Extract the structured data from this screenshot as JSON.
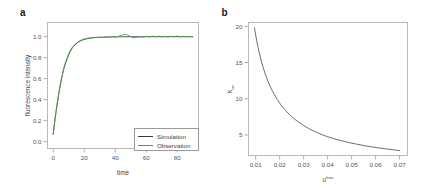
{
  "figure": {
    "panels": [
      {
        "letter": "a",
        "chart_data": {
          "type": "line",
          "title": "",
          "xlabel": "time",
          "ylabel": "fluorescence intensity",
          "xlim": [
            -4,
            94
          ],
          "ylim": [
            -0.07,
            1.14
          ],
          "xticks": [
            0,
            20,
            40,
            60,
            80
          ],
          "xtick_labels": [
            "0",
            "20",
            "40",
            "60",
            "80"
          ],
          "yticks": [
            0.0,
            0.2,
            0.4,
            0.6,
            0.8,
            1.0
          ],
          "ytick_labels": [
            "0.0",
            "0.2",
            "0.4",
            "0.6",
            "0.8",
            "1.0"
          ],
          "grid": false,
          "legend_position": "lower right",
          "series": [
            {
              "name": "Simulation",
              "color": "#3a3a3a",
              "x": [
                0,
                1,
                2,
                3,
                4,
                5,
                6,
                7,
                8,
                9,
                10,
                11,
                12,
                13,
                14,
                15,
                16,
                17,
                18,
                19,
                20,
                22,
                24,
                26,
                28,
                30,
                34,
                38,
                42,
                46,
                50,
                54,
                58,
                62,
                66,
                70,
                74,
                78,
                82,
                86,
                90
              ],
              "values": [
                0.07,
                0.19,
                0.3,
                0.4,
                0.49,
                0.57,
                0.64,
                0.7,
                0.75,
                0.79,
                0.83,
                0.86,
                0.885,
                0.905,
                0.922,
                0.936,
                0.947,
                0.956,
                0.963,
                0.969,
                0.974,
                0.981,
                0.986,
                0.99,
                0.992,
                0.994,
                0.996,
                0.998,
                0.999,
                1.0,
                1.0,
                1.0,
                1.0,
                1.0,
                1.0,
                1.0,
                1.0,
                1.0,
                1.0,
                1.0,
                1.0
              ]
            },
            {
              "name": "Observation",
              "color": "#4e9c4e",
              "x": [
                0,
                1,
                2,
                3,
                4,
                5,
                6,
                7,
                8,
                9,
                10,
                11,
                12,
                13,
                14,
                15,
                16,
                17,
                18,
                19,
                20,
                22,
                24,
                26,
                28,
                30,
                32,
                34,
                36,
                38,
                40,
                42,
                44,
                45,
                46,
                47,
                48,
                49,
                50,
                51,
                52,
                54,
                56,
                58,
                60,
                62,
                64,
                66,
                68,
                70,
                72,
                74,
                76,
                78,
                80,
                82,
                84,
                86,
                88,
                90
              ],
              "values": [
                0.07,
                0.2,
                0.31,
                0.41,
                0.5,
                0.58,
                0.65,
                0.71,
                0.76,
                0.8,
                0.84,
                0.87,
                0.892,
                0.911,
                0.927,
                0.94,
                0.951,
                0.96,
                0.967,
                0.973,
                0.978,
                0.985,
                0.99,
                0.993,
                0.994,
                0.996,
                0.993,
                0.999,
                0.995,
                1.002,
                0.996,
                1.004,
                1.012,
                1.018,
                1.021,
                1.02,
                1.016,
                1.009,
                1.0,
                0.993,
                0.989,
                0.994,
                1.0,
                0.995,
                1.004,
                0.998,
                1.006,
                0.999,
                1.005,
                0.998,
                1.004,
                0.997,
                1.005,
                1.0,
                1.006,
                0.999,
                1.004,
                0.998,
                1.003,
                0.999
              ]
            }
          ],
          "legend": [
            {
              "label": "Simulation",
              "color": "#3a3a3a"
            },
            {
              "label": "Observation",
              "color": "#4e9c4e"
            }
          ]
        }
      },
      {
        "letter": "b",
        "chart_data": {
          "type": "line",
          "title": "",
          "xlabel": "u",
          "xlabel_sup": "free",
          "ylabel": "k",
          "ylabel_sub": "on",
          "xlim": [
            0.0068,
            0.0735
          ],
          "ylim": [
            2.1,
            20.6
          ],
          "xticks": [
            0.01,
            0.02,
            0.03,
            0.04,
            0.05,
            0.06,
            0.07
          ],
          "xtick_labels": [
            "0.01",
            "0.02",
            "0.03",
            "0.04",
            "0.05",
            "0.06",
            "0.07"
          ],
          "yticks": [
            5,
            10,
            15,
            20
          ],
          "ytick_labels": [
            "5",
            "10",
            "15",
            "20"
          ],
          "grid": false,
          "legend_position": "none",
          "series": [
            {
              "name": "k_on vs u_free",
              "color": "#4a4a4a",
              "x": [
                0.0095,
                0.01,
                0.0105,
                0.011,
                0.0115,
                0.012,
                0.0125,
                0.013,
                0.014,
                0.015,
                0.016,
                0.017,
                0.018,
                0.019,
                0.02,
                0.021,
                0.022,
                0.023,
                0.024,
                0.025,
                0.026,
                0.028,
                0.03,
                0.032,
                0.034,
                0.036,
                0.038,
                0.04,
                0.043,
                0.046,
                0.049,
                0.052,
                0.055,
                0.058,
                0.061,
                0.064,
                0.067,
                0.07
              ],
              "values": [
                19.8,
                18.8,
                17.9,
                17.1,
                16.35,
                15.65,
                15.0,
                14.45,
                13.4,
                12.5,
                11.75,
                11.05,
                10.45,
                9.9,
                9.4,
                8.95,
                8.55,
                8.2,
                7.85,
                7.55,
                7.25,
                6.75,
                6.3,
                5.92,
                5.58,
                5.28,
                5.0,
                4.76,
                4.45,
                4.18,
                3.95,
                3.74,
                3.55,
                3.38,
                3.23,
                3.1,
                2.97,
                2.85
              ]
            }
          ]
        }
      }
    ]
  }
}
